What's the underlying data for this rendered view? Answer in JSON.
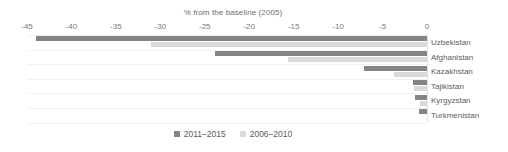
{
  "chart_data": {
    "type": "bar",
    "orientation": "horizontal",
    "title": "% from the baseline (2005)",
    "xlabel": "",
    "ylabel": "",
    "xlim": [
      -45,
      0
    ],
    "xticks": [
      -45,
      -40,
      -35,
      -30,
      -25,
      -20,
      -15,
      -10,
      -5,
      0
    ],
    "xtick_labels": [
      "-45",
      "-40",
      "-35",
      "-30",
      "-25",
      "-20",
      "-15",
      "-10",
      "-5",
      "0"
    ],
    "grid": true,
    "legend_position": "bottom",
    "categories": [
      "Uzbekistan",
      "Afghanistan",
      "Kazakhstan",
      "Tajikistan",
      "Kyrgyzstan",
      "Turkmenistan"
    ],
    "series": [
      {
        "name": "2011–2015",
        "color": "#848484",
        "values": [
          -44.0,
          -23.8,
          -7.1,
          -1.6,
          -1.3,
          -0.9
        ]
      },
      {
        "name": "2006–2010",
        "color": "#d9d9d9",
        "values": [
          -31.0,
          -15.6,
          -3.7,
          -1.5,
          -0.8,
          0.0
        ]
      }
    ]
  },
  "legend": {
    "items": [
      {
        "label": "2011–2015",
        "color": "#848484"
      },
      {
        "label": "2006–2010",
        "color": "#d9d9d9"
      }
    ]
  },
  "colors": {
    "recent": "#848484",
    "prior": "#d9d9d9",
    "grid": "#f2f2f2",
    "text": "#5b5b5b",
    "axis_text": "#7a7a7a",
    "title_text": "#6e6e6e",
    "background": "#ffffff"
  }
}
